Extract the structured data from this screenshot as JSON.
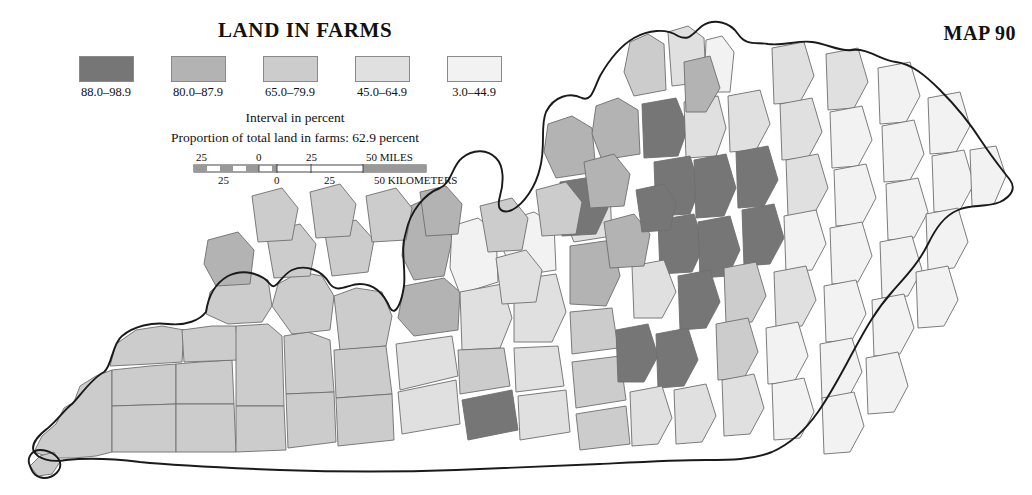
{
  "header": {
    "title": "LAND IN FARMS",
    "map_number": "MAP 90"
  },
  "legend": {
    "caption": "Interval in percent",
    "subcaption": "Proportion of total land in farms: 62.9 percent",
    "classes": [
      {
        "label": "88.0–98.9",
        "color": "#767676"
      },
      {
        "label": "80.0–87.9",
        "color": "#b3b3b3"
      },
      {
        "label": "65.0–79.9",
        "color": "#cccccc"
      },
      {
        "label": "45.0–64.9",
        "color": "#e0e0e0"
      },
      {
        "label": "3.0–44.9",
        "color": "#f2f2f2"
      }
    ]
  },
  "scalebar": {
    "miles_unit": "50 MILES",
    "kilometers_unit": "50 KILOMETERS",
    "miles_ticks": [
      "25",
      "0",
      "25"
    ],
    "kilometers_ticks": [
      "25",
      "0",
      "25"
    ]
  },
  "chart_data": {
    "type": "map",
    "title": "LAND IN FARMS",
    "subtitle": "Proportion of total land in farms: 62.9 percent",
    "region": "Kentucky",
    "unit": "percent",
    "legend_position": "top-left",
    "classes": [
      {
        "label": "88.0–98.9",
        "min": 88.0,
        "max": 98.9,
        "color": "#767676"
      },
      {
        "label": "80.0–87.9",
        "min": 80.0,
        "max": 87.9,
        "color": "#b3b3b3"
      },
      {
        "label": "65.0–79.9",
        "min": 65.0,
        "max": 79.9,
        "color": "#cccccc"
      },
      {
        "label": "45.0–64.9",
        "min": 45.0,
        "max": 64.9,
        "color": "#e0e0e0"
      },
      {
        "label": "3.0–44.9",
        "min": 3.0,
        "max": 44.9,
        "color": "#f2f2f2"
      }
    ],
    "features": [
      {
        "id": "c01",
        "class": 2,
        "cx": 60,
        "cy": 390,
        "pts": "34,452 42,436 56,424 64,408 74,402 80,386 96,376 112,370 112,452 96,456 74,458 52,458"
      },
      {
        "id": "c02",
        "class": 2,
        "cx": 56,
        "cy": 462,
        "pts": "30,466 40,456 54,452 60,462 52,474 38,476"
      },
      {
        "id": "c03",
        "class": 2,
        "cx": 140,
        "cy": 400,
        "pts": "112,370 150,366 176,364 176,404 112,406"
      },
      {
        "id": "c04",
        "class": 2,
        "cx": 140,
        "cy": 432,
        "pts": "112,406 176,404 176,452 112,452"
      },
      {
        "id": "c05",
        "class": 2,
        "cx": 206,
        "cy": 392,
        "pts": "176,364 200,362 232,360 234,404 176,404"
      },
      {
        "id": "c06",
        "class": 2,
        "cx": 206,
        "cy": 430,
        "pts": "176,404 234,404 236,452 176,452"
      },
      {
        "id": "c07",
        "class": 2,
        "cx": 148,
        "cy": 350,
        "pts": "110,366 116,344 136,330 162,326 184,330 182,362 150,364"
      },
      {
        "id": "c08",
        "class": 2,
        "cx": 206,
        "cy": 348,
        "pts": "182,330 212,326 236,326 238,360 184,362"
      },
      {
        "id": "c09",
        "class": 2,
        "cx": 262,
        "cy": 396,
        "pts": "236,326 268,324 282,336 284,406 236,406"
      },
      {
        "id": "c10",
        "class": 2,
        "cx": 262,
        "cy": 434,
        "pts": "236,406 284,406 286,450 236,452"
      },
      {
        "id": "c11",
        "class": 2,
        "cx": 244,
        "cy": 296,
        "pts": "206,314 210,292 226,278 248,272 268,280 272,306 262,322 228,324"
      },
      {
        "id": "c12",
        "class": 2,
        "cx": 312,
        "cy": 386,
        "pts": "284,336 308,332 330,340 334,392 286,394"
      },
      {
        "id": "c13",
        "class": 2,
        "cx": 312,
        "cy": 426,
        "pts": "286,394 334,392 336,442 288,448"
      },
      {
        "id": "c14",
        "class": 2,
        "cx": 306,
        "cy": 306,
        "pts": "272,306 278,284 300,272 322,276 334,296 330,330 292,334"
      },
      {
        "id": "c15",
        "class": 2,
        "cx": 364,
        "cy": 330,
        "pts": "334,296 356,288 382,292 392,316 386,346 340,350"
      },
      {
        "id": "c16",
        "class": 2,
        "cx": 366,
        "cy": 394,
        "pts": "334,350 386,346 392,394 336,398"
      },
      {
        "id": "c17",
        "class": 2,
        "cx": 364,
        "cy": 432,
        "pts": "336,398 392,394 394,440 338,446"
      },
      {
        "id": "c18",
        "class": 1,
        "cx": 432,
        "cy": 238,
        "pts": "406,208 428,198 446,204 452,240 444,276 414,280 402,256"
      },
      {
        "id": "c19",
        "class": 1,
        "cx": 432,
        "cy": 306,
        "pts": "404,286 444,278 460,292 458,330 414,336 398,318"
      },
      {
        "id": "c20",
        "class": 3,
        "cx": 428,
        "cy": 366,
        "pts": "396,344 452,336 458,376 400,390"
      },
      {
        "id": "c21",
        "class": 3,
        "cx": 424,
        "cy": 418,
        "pts": "398,392 456,380 460,424 402,434"
      },
      {
        "id": "c22",
        "class": 4,
        "cx": 478,
        "cy": 262,
        "pts": "452,226 478,218 496,232 498,282 460,294 450,268"
      },
      {
        "id": "c23",
        "class": 3,
        "cx": 494,
        "cy": 318,
        "pts": "460,292 502,284 512,318 500,348 462,350"
      },
      {
        "id": "c24",
        "class": 2,
        "cx": 490,
        "cy": 382,
        "pts": "458,350 504,348 510,386 460,394"
      },
      {
        "id": "c25",
        "class": 0,
        "cx": 492,
        "cy": 424,
        "pts": "462,400 512,390 518,430 468,440"
      },
      {
        "id": "c26",
        "class": 4,
        "cx": 540,
        "cy": 248,
        "pts": "508,220 534,212 554,224 556,270 516,276 504,252"
      },
      {
        "id": "c27",
        "class": 3,
        "cx": 548,
        "cy": 312,
        "pts": "514,280 556,274 566,312 552,342 514,342"
      },
      {
        "id": "c28",
        "class": 3,
        "cx": 548,
        "cy": 378,
        "pts": "514,348 558,346 564,386 516,392"
      },
      {
        "id": "c29",
        "class": 3,
        "cx": 550,
        "cy": 424,
        "pts": "518,396 566,390 570,432 520,440"
      },
      {
        "id": "c30",
        "class": 3,
        "cx": 596,
        "cy": 214,
        "pts": "566,188 590,180 610,192 612,236 574,242 562,214"
      },
      {
        "id": "c31",
        "class": 1,
        "cx": 596,
        "cy": 274,
        "pts": "570,246 612,240 620,276 606,306 570,304"
      },
      {
        "id": "c32",
        "class": 2,
        "cx": 602,
        "cy": 340,
        "pts": "570,312 612,308 618,348 572,354"
      },
      {
        "id": "c33",
        "class": 2,
        "cx": 604,
        "cy": 394,
        "pts": "572,362 620,356 626,400 576,408"
      },
      {
        "id": "c34",
        "class": 2,
        "cx": 602,
        "cy": 436,
        "pts": "576,414 626,406 630,444 580,450"
      },
      {
        "id": "c35",
        "class": 1,
        "cx": 576,
        "cy": 150,
        "pts": "548,124 572,116 592,128 596,172 556,178 544,152"
      },
      {
        "id": "c36",
        "class": 1,
        "cx": 620,
        "cy": 132,
        "pts": "596,106 618,98 638,110 640,154 602,160 592,134"
      },
      {
        "id": "c37",
        "class": 0,
        "cx": 588,
        "cy": 204,
        "pts": "560,182 598,176 608,208 596,234 562,236"
      },
      {
        "id": "c38",
        "class": 2,
        "cx": 648,
        "cy": 72,
        "pts": "630,42 648,34 664,44 666,90 634,96 624,72"
      },
      {
        "id": "c39",
        "class": 3,
        "cx": 690,
        "cy": 58,
        "pts": "668,32 688,26 704,38 706,82 672,86"
      },
      {
        "id": "c40",
        "class": 4,
        "cx": 712,
        "cy": 70,
        "pts": "706,40 722,36 734,52 730,92 704,92"
      },
      {
        "id": "c41",
        "class": 0,
        "cx": 668,
        "cy": 130,
        "pts": "642,104 676,98 688,128 678,156 644,158"
      },
      {
        "id": "c42",
        "class": 3,
        "cx": 708,
        "cy": 128,
        "pts": "684,102 718,96 726,128 716,156 686,158"
      },
      {
        "id": "c43",
        "class": 0,
        "cx": 680,
        "cy": 188,
        "pts": "654,162 690,156 700,188 690,214 656,216"
      },
      {
        "id": "c44",
        "class": 0,
        "cx": 714,
        "cy": 188,
        "pts": "694,160 726,154 736,188 724,216 696,218"
      },
      {
        "id": "c45",
        "class": 0,
        "cx": 684,
        "cy": 244,
        "pts": "658,220 694,214 704,246 692,272 660,274"
      },
      {
        "id": "c46",
        "class": 0,
        "cx": 722,
        "cy": 250,
        "pts": "698,222 730,216 740,250 728,276 700,278"
      },
      {
        "id": "c47",
        "class": 3,
        "cx": 656,
        "cy": 290,
        "pts": "632,266 664,260 676,292 662,318 634,318"
      },
      {
        "id": "c48",
        "class": 0,
        "cx": 700,
        "cy": 300,
        "pts": "678,276 710,270 720,302 706,328 680,330"
      },
      {
        "id": "c49",
        "class": 0,
        "cx": 638,
        "cy": 354,
        "pts": "616,330 648,324 658,356 644,382 618,382"
      },
      {
        "id": "c50",
        "class": 0,
        "cx": 678,
        "cy": 358,
        "pts": "656,334 688,328 698,360 684,386 658,388"
      },
      {
        "id": "c51",
        "class": 3,
        "cx": 652,
        "cy": 416,
        "pts": "630,392 662,386 672,418 658,444 632,446"
      },
      {
        "id": "c52",
        "class": 3,
        "cx": 694,
        "cy": 414,
        "pts": "674,390 706,384 716,416 702,442 676,444"
      },
      {
        "id": "c53",
        "class": 3,
        "cx": 748,
        "cy": 122,
        "pts": "728,96 760,90 770,124 756,150 730,152"
      },
      {
        "id": "c54",
        "class": 0,
        "cx": 756,
        "cy": 176,
        "pts": "736,152 768,146 778,180 764,206 738,208"
      },
      {
        "id": "c55",
        "class": 0,
        "cx": 762,
        "cy": 234,
        "pts": "742,210 774,204 784,238 770,264 744,266"
      },
      {
        "id": "c56",
        "class": 2,
        "cx": 744,
        "cy": 292,
        "pts": "724,268 756,262 766,296 752,322 726,324"
      },
      {
        "id": "c57",
        "class": 2,
        "cx": 736,
        "cy": 348,
        "pts": "716,324 748,318 758,352 744,378 718,380"
      },
      {
        "id": "c58",
        "class": 3,
        "cx": 742,
        "cy": 404,
        "pts": "722,380 754,374 764,408 750,434 724,436"
      },
      {
        "id": "c59",
        "class": 3,
        "cx": 792,
        "cy": 72,
        "pts": "772,48 804,42 814,76 800,102 774,104"
      },
      {
        "id": "c60",
        "class": 3,
        "cx": 800,
        "cy": 128,
        "pts": "780,104 812,98 822,132 808,158 782,160"
      },
      {
        "id": "c61",
        "class": 3,
        "cx": 806,
        "cy": 184,
        "pts": "786,160 818,154 828,188 814,214 788,216"
      },
      {
        "id": "c62",
        "class": 4,
        "cx": 804,
        "cy": 240,
        "pts": "784,216 816,210 826,244 812,270 786,272"
      },
      {
        "id": "c63",
        "class": 3,
        "cx": 794,
        "cy": 296,
        "pts": "774,272 806,266 816,300 802,326 776,328"
      },
      {
        "id": "c64",
        "class": 4,
        "cx": 786,
        "cy": 352,
        "pts": "766,328 798,322 808,356 794,382 768,384"
      },
      {
        "id": "c65",
        "class": 4,
        "cx": 792,
        "cy": 408,
        "pts": "772,384 804,378 814,412 800,438 774,440"
      },
      {
        "id": "c66",
        "class": 3,
        "cx": 846,
        "cy": 78,
        "pts": "826,54 858,48 868,82 854,108 828,110"
      },
      {
        "id": "c67",
        "class": 4,
        "cx": 850,
        "cy": 136,
        "pts": "830,112 862,106 872,140 858,166 832,168"
      },
      {
        "id": "c68",
        "class": 4,
        "cx": 854,
        "cy": 194,
        "pts": "834,170 866,164 876,198 862,224 836,226"
      },
      {
        "id": "c69",
        "class": 4,
        "cx": 850,
        "cy": 252,
        "pts": "830,228 862,222 872,256 858,282 832,284"
      },
      {
        "id": "c70",
        "class": 4,
        "cx": 844,
        "cy": 310,
        "pts": "824,286 856,280 866,314 852,340 826,342"
      },
      {
        "id": "c71",
        "class": 4,
        "cx": 840,
        "cy": 368,
        "pts": "820,344 852,338 862,372 848,398 822,400"
      },
      {
        "id": "c72",
        "class": 4,
        "cx": 842,
        "cy": 422,
        "pts": "822,398 854,392 864,426 850,452 824,454"
      },
      {
        "id": "c73",
        "class": 4,
        "cx": 898,
        "cy": 92,
        "pts": "878,68 910,62 920,96 906,122 880,124"
      },
      {
        "id": "c74",
        "class": 4,
        "cx": 902,
        "cy": 150,
        "pts": "882,126 914,120 924,154 910,180 884,182"
      },
      {
        "id": "c75",
        "class": 4,
        "cx": 906,
        "cy": 208,
        "pts": "886,184 918,178 928,212 914,238 888,240"
      },
      {
        "id": "c76",
        "class": 4,
        "cx": 900,
        "cy": 266,
        "pts": "880,242 912,236 922,270 908,296 882,298"
      },
      {
        "id": "c77",
        "class": 4,
        "cx": 892,
        "cy": 324,
        "pts": "872,300 904,294 914,328 900,354 874,356"
      },
      {
        "id": "c78",
        "class": 4,
        "cx": 886,
        "cy": 382,
        "pts": "866,358 898,352 908,386 894,412 868,414"
      },
      {
        "id": "c79",
        "class": 4,
        "cx": 948,
        "cy": 122,
        "pts": "928,98 960,92 970,126 956,152 930,154"
      },
      {
        "id": "c80",
        "class": 4,
        "cx": 952,
        "cy": 180,
        "pts": "932,156 964,150 974,184 960,210 934,212"
      },
      {
        "id": "c81",
        "class": 4,
        "cx": 946,
        "cy": 238,
        "pts": "926,214 958,208 968,242 954,268 928,270"
      },
      {
        "id": "c82",
        "class": 4,
        "cx": 936,
        "cy": 296,
        "pts": "916,272 948,266 958,300 944,326 918,328"
      },
      {
        "id": "c83",
        "class": 4,
        "cx": 984,
        "cy": 176,
        "pts": "970,150 996,146 1006,176 994,204 972,206"
      },
      {
        "id": "c84",
        "class": 1,
        "cx": 236,
        "cy": 260,
        "pts": "208,240 238,232 254,250 250,284 216,286 204,264"
      },
      {
        "id": "c85",
        "class": 2,
        "cx": 296,
        "cy": 252,
        "pts": "266,232 300,224 316,244 310,276 274,278"
      },
      {
        "id": "c86",
        "class": 2,
        "cx": 352,
        "cy": 250,
        "pts": "324,228 356,220 374,240 368,272 332,276"
      },
      {
        "id": "c87",
        "class": 1,
        "cx": 446,
        "cy": 208,
        "pts": "420,192 446,186 462,204 458,234 426,236"
      },
      {
        "id": "c88",
        "class": 2,
        "cx": 506,
        "cy": 226,
        "pts": "480,206 512,198 528,218 522,250 488,252"
      },
      {
        "id": "c89",
        "class": 2,
        "cx": 560,
        "cy": 210,
        "pts": "536,190 566,182 582,202 576,234 542,236"
      },
      {
        "id": "c90",
        "class": 1,
        "cx": 608,
        "cy": 182,
        "pts": "584,162 614,154 630,174 624,206 590,208"
      },
      {
        "id": "c91",
        "class": 3,
        "cx": 520,
        "cy": 280,
        "pts": "496,258 526,250 542,270 536,302 502,304"
      },
      {
        "id": "c92",
        "class": 1,
        "cx": 628,
        "cy": 242,
        "pts": "604,222 634,214 650,234 644,266 610,268"
      },
      {
        "id": "c93",
        "class": 0,
        "cx": 654,
        "cy": 208,
        "pts": "636,190 664,184 676,202 670,230 642,232"
      },
      {
        "id": "c94",
        "class": 2,
        "cx": 278,
        "cy": 214,
        "pts": "252,196 282,188 298,208 292,240 258,242"
      },
      {
        "id": "c95",
        "class": 2,
        "cx": 334,
        "cy": 212,
        "pts": "310,192 340,184 356,204 350,236 316,238"
      },
      {
        "id": "c96",
        "class": 2,
        "cx": 390,
        "cy": 216,
        "pts": "366,196 396,188 412,208 406,240 372,242"
      },
      {
        "id": "c97",
        "class": 1,
        "cx": 700,
        "cy": 86,
        "pts": "684,62 710,56 720,88 706,112 686,112"
      }
    ]
  }
}
